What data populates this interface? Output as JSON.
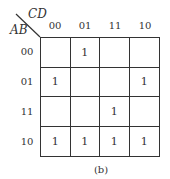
{
  "kmap": {
    "col_variable": "CD",
    "row_variable": "AB",
    "col_labels": [
      "00",
      "01",
      "11",
      "10"
    ],
    "row_labels": [
      "00",
      "01",
      "11",
      "10"
    ],
    "cells": [
      [
        "",
        "1",
        "",
        ""
      ],
      [
        "1",
        "",
        "",
        "1"
      ],
      [
        "",
        "",
        "1",
        ""
      ],
      [
        "1",
        "1",
        "1",
        "1"
      ]
    ]
  },
  "caption": "(b)"
}
